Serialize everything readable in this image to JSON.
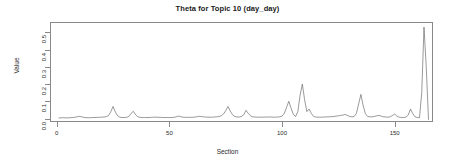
{
  "chart_data": {
    "type": "line",
    "title": "Theta for Topic 10 (day_day)",
    "xlabel": "Section",
    "ylabel": "Value",
    "xlim": [
      -3,
      167
    ],
    "ylim": [
      -0.02,
      0.56
    ],
    "grid": false,
    "legend": null,
    "xticks": [
      0,
      50,
      100,
      150
    ],
    "xtick_labels": [
      "0",
      "50",
      "100",
      "150"
    ],
    "yticks": [
      0.0,
      0.1,
      0.2,
      0.3,
      0.4,
      0.5
    ],
    "ytick_labels": [
      "0.0",
      "0.1",
      "0.2",
      "0.3",
      "0.4",
      "0.5"
    ],
    "line_color": "#555555",
    "series": [
      {
        "name": "theta",
        "x": [
          1,
          2,
          3,
          4,
          5,
          6,
          7,
          8,
          9,
          10,
          11,
          12,
          13,
          14,
          15,
          16,
          17,
          18,
          19,
          20,
          21,
          22,
          23,
          24,
          25,
          26,
          27,
          28,
          29,
          30,
          31,
          32,
          33,
          34,
          35,
          36,
          37,
          38,
          39,
          40,
          41,
          42,
          43,
          44,
          45,
          46,
          47,
          48,
          49,
          50,
          51,
          52,
          53,
          54,
          55,
          56,
          57,
          58,
          59,
          60,
          61,
          62,
          63,
          64,
          65,
          66,
          67,
          68,
          69,
          70,
          71,
          72,
          73,
          74,
          75,
          76,
          77,
          78,
          79,
          80,
          81,
          82,
          83,
          84,
          85,
          86,
          87,
          88,
          89,
          90,
          91,
          92,
          93,
          94,
          95,
          96,
          97,
          98,
          99,
          100,
          101,
          102,
          103,
          104,
          105,
          106,
          107,
          108,
          109,
          110,
          111,
          112,
          113,
          114,
          115,
          116,
          117,
          118,
          119,
          120,
          121,
          122,
          123,
          124,
          125,
          126,
          127,
          128,
          129,
          130,
          131,
          132,
          133,
          134,
          135,
          136,
          137,
          138,
          139,
          140,
          141,
          142,
          143,
          144,
          145,
          146,
          147,
          148,
          149,
          150,
          151,
          152,
          153,
          154,
          155,
          156,
          157,
          158,
          159,
          160,
          161,
          162,
          163,
          164,
          165
        ],
        "values": [
          0.004,
          0.004,
          0.005,
          0.004,
          0.004,
          0.005,
          0.006,
          0.007,
          0.01,
          0.013,
          0.01,
          0.007,
          0.005,
          0.005,
          0.005,
          0.006,
          0.006,
          0.007,
          0.007,
          0.008,
          0.009,
          0.011,
          0.018,
          0.04,
          0.07,
          0.038,
          0.016,
          0.008,
          0.006,
          0.006,
          0.007,
          0.012,
          0.03,
          0.042,
          0.022,
          0.01,
          0.007,
          0.006,
          0.006,
          0.006,
          0.006,
          0.007,
          0.008,
          0.008,
          0.007,
          0.007,
          0.006,
          0.006,
          0.006,
          0.006,
          0.006,
          0.007,
          0.01,
          0.014,
          0.011,
          0.008,
          0.007,
          0.007,
          0.007,
          0.007,
          0.008,
          0.01,
          0.013,
          0.012,
          0.01,
          0.009,
          0.008,
          0.008,
          0.008,
          0.009,
          0.01,
          0.012,
          0.016,
          0.026,
          0.046,
          0.07,
          0.044,
          0.022,
          0.012,
          0.009,
          0.009,
          0.012,
          0.022,
          0.048,
          0.03,
          0.016,
          0.01,
          0.009,
          0.008,
          0.008,
          0.008,
          0.008,
          0.009,
          0.009,
          0.009,
          0.008,
          0.008,
          0.009,
          0.01,
          0.014,
          0.03,
          0.065,
          0.1,
          0.06,
          0.024,
          0.012,
          0.04,
          0.135,
          0.2,
          0.11,
          0.04,
          0.055,
          0.03,
          0.012,
          0.009,
          0.008,
          0.008,
          0.008,
          0.009,
          0.01,
          0.01,
          0.011,
          0.012,
          0.014,
          0.016,
          0.018,
          0.02,
          0.024,
          0.018,
          0.012,
          0.01,
          0.012,
          0.03,
          0.085,
          0.14,
          0.075,
          0.028,
          0.012,
          0.01,
          0.01,
          0.012,
          0.016,
          0.018,
          0.014,
          0.01,
          0.009,
          0.008,
          0.01,
          0.018,
          0.026,
          0.014,
          0.008,
          0.006,
          0.006,
          0.008,
          0.02,
          0.055,
          0.03,
          0.01,
          0.006,
          0.005,
          0.15,
          0.53,
          0.3,
          -0.005
        ]
      }
    ]
  },
  "axis": {
    "ylabel_text": "Value",
    "xlabel_text": "Section"
  }
}
